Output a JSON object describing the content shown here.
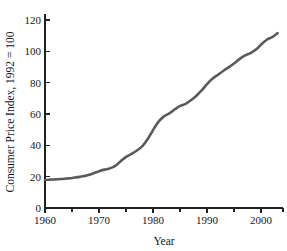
{
  "chart_data": {
    "type": "line",
    "title": "",
    "xlabel": "Year",
    "ylabel": "Consumer Price Index, 1992 = 100",
    "xlim": [
      1960,
      2004
    ],
    "ylim": [
      0,
      128
    ],
    "grid": false,
    "legend": null,
    "line_color": "#5a5a5a",
    "x_major_ticks": [
      1960,
      1970,
      1980,
      1990,
      2000
    ],
    "x_major_tick_labels": [
      "1960",
      "1970",
      "1980",
      "1990",
      "2000"
    ],
    "x_minor_ticks": [
      1965,
      1975,
      1985,
      1995
    ],
    "y_ticks": [
      0,
      20,
      40,
      60,
      80,
      100,
      120
    ],
    "y_tick_labels": [
      "0",
      "20",
      "40",
      "60",
      "80",
      "100",
      "120"
    ],
    "series": [
      {
        "name": "Consumer Price Index",
        "x": [
          1960,
          1961,
          1962,
          1963,
          1964,
          1965,
          1966,
          1967,
          1968,
          1969,
          1970,
          1971,
          1972,
          1973,
          1974,
          1975,
          1976,
          1977,
          1978,
          1979,
          1980,
          1981,
          1982,
          1983,
          1984,
          1985,
          1986,
          1987,
          1988,
          1989,
          1990,
          1991,
          1992,
          1993,
          1994,
          1995,
          1996,
          1997,
          1998,
          1999,
          2000,
          2001,
          2002,
          2003
        ],
        "values": [
          17.9,
          18.1,
          18.3,
          18.5,
          18.8,
          19.1,
          19.7,
          20.2,
          21.1,
          22.2,
          23.5,
          24.5,
          25.3,
          26.9,
          29.9,
          32.6,
          34.5,
          36.7,
          39.5,
          44.0,
          49.9,
          55.1,
          58.5,
          60.4,
          63.0,
          65.2,
          66.4,
          68.9,
          71.7,
          75.2,
          79.3,
          82.6,
          85.1,
          87.6,
          89.9,
          92.4,
          95.2,
          97.4,
          98.9,
          101.1,
          104.5,
          107.4,
          109.1,
          111.6
        ]
      }
    ],
    "note": "Curve rises from about 18 in 1960 to about 122 in 2003; nearly flat through the 1960s, steep through the late 1970s and early 1980s, with a short plateau near 100 around 1991-1994."
  },
  "axis_labels": {
    "x_title": "Year",
    "y_title": "Consumer Price Index, 1992 = 100"
  }
}
